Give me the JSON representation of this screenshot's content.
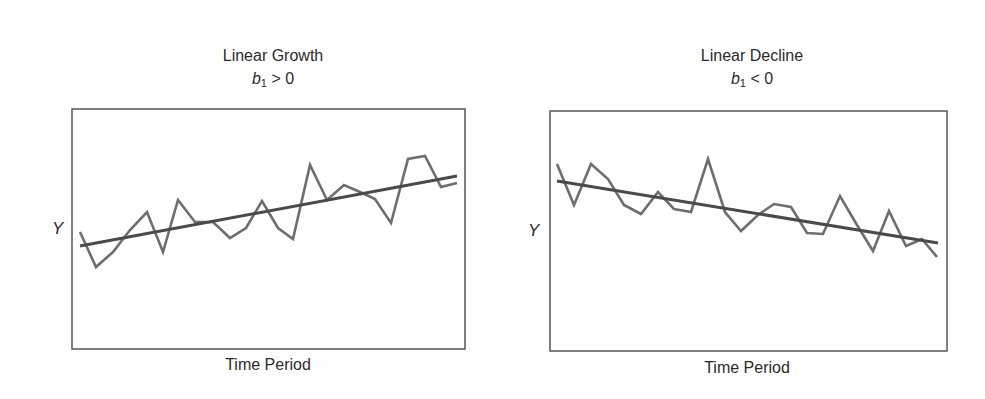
{
  "chart_data": [
    {
      "type": "line",
      "title": "Linear Growth",
      "subtitle": "b1 > 0",
      "subtitle_parts": {
        "var": "b",
        "sub": "1",
        "rest": " > 0"
      },
      "xlabel": "Time Period",
      "ylabel": "Y",
      "grid": false,
      "legend": "none",
      "x": [
        1,
        2,
        3,
        4,
        5,
        6,
        7,
        8,
        9,
        10,
        11,
        12,
        13,
        14,
        15,
        16,
        17,
        18,
        19,
        20,
        21,
        22,
        23,
        24
      ],
      "series": [
        {
          "name": "observed",
          "color": "#6e6e6e",
          "values": [
            46,
            38,
            42,
            47,
            51,
            42,
            54,
            49,
            49,
            45,
            47,
            54,
            47,
            45,
            62,
            54,
            58,
            56,
            54,
            49,
            63,
            64,
            57,
            58
          ]
        },
        {
          "name": "trend",
          "color": "#4a4a4a",
          "values_endpoints": [
            43,
            59
          ]
        }
      ],
      "box_px": {
        "x": 72,
        "y": 109,
        "w": 393,
        "h": 240
      },
      "points_px": [
        [
          80,
          232
        ],
        [
          96,
          267
        ],
        [
          113,
          252
        ],
        [
          130,
          230
        ],
        [
          147,
          212
        ],
        [
          163,
          252
        ],
        [
          178,
          200
        ],
        [
          195,
          222
        ],
        [
          213,
          222
        ],
        [
          230,
          238
        ],
        [
          246,
          228
        ],
        [
          262,
          201
        ],
        [
          278,
          228
        ],
        [
          293,
          239
        ],
        [
          310,
          165
        ],
        [
          327,
          200
        ],
        [
          344,
          185
        ],
        [
          360,
          192
        ],
        [
          375,
          199
        ],
        [
          391,
          223
        ],
        [
          408,
          159
        ],
        [
          425,
          156
        ],
        [
          441,
          187
        ],
        [
          457,
          183
        ]
      ],
      "trend_px": [
        [
          80,
          246
        ],
        [
          457,
          176
        ]
      ]
    },
    {
      "type": "line",
      "title": "Linear Decline",
      "subtitle": "b1 < 0",
      "subtitle_parts": {
        "var": "b",
        "sub": "1",
        "rest": " < 0"
      },
      "xlabel": "Time Period",
      "ylabel": "Y",
      "grid": false,
      "legend": "none",
      "x": [
        1,
        2,
        3,
        4,
        5,
        6,
        7,
        8,
        9,
        10,
        11,
        12,
        13,
        14,
        15,
        16,
        17,
        18,
        19,
        20,
        21,
        22,
        23,
        24
      ],
      "series": [
        {
          "name": "observed",
          "color": "#6e6e6e",
          "values": [
            62,
            53,
            62,
            58,
            53,
            51,
            56,
            52,
            51,
            63,
            51,
            47,
            51,
            53,
            52,
            46,
            46,
            55,
            48,
            42,
            51,
            43,
            45,
            41
          ]
        },
        {
          "name": "trend",
          "color": "#4a4a4a",
          "values_endpoints": [
            58,
            44
          ]
        }
      ],
      "box_px": {
        "x": 550,
        "y": 111,
        "w": 397,
        "h": 240
      },
      "points_px": [
        [
          557,
          164
        ],
        [
          574,
          205
        ],
        [
          591,
          164
        ],
        [
          608,
          179
        ],
        [
          624,
          205
        ],
        [
          641,
          214
        ],
        [
          658,
          192
        ],
        [
          674,
          209
        ],
        [
          691,
          212
        ],
        [
          708,
          159
        ],
        [
          725,
          212
        ],
        [
          741,
          231
        ],
        [
          758,
          215
        ],
        [
          774,
          204
        ],
        [
          791,
          207
        ],
        [
          807,
          233
        ],
        [
          823,
          234
        ],
        [
          840,
          196
        ],
        [
          857,
          225
        ],
        [
          873,
          251
        ],
        [
          889,
          211
        ],
        [
          906,
          246
        ],
        [
          922,
          239
        ],
        [
          937,
          257
        ]
      ],
      "trend_px": [
        [
          557,
          181
        ],
        [
          938,
          243
        ]
      ]
    }
  ]
}
